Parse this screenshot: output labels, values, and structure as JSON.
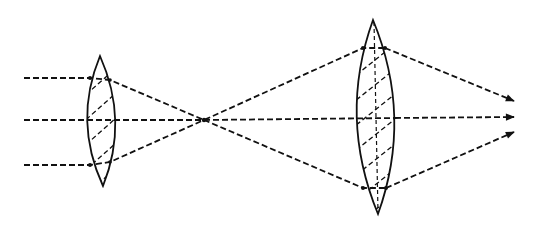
{
  "diagram": {
    "type": "optical ray diagram",
    "colors": {
      "ink": "#111111",
      "background": "#ffffff"
    },
    "lenses": [
      {
        "id": "lens-small-left",
        "cx": 101,
        "top": 56,
        "bottom": 186,
        "half_width": 14,
        "hatched": true
      },
      {
        "id": "lens-large-right",
        "cx": 375,
        "top": 20,
        "bottom": 214,
        "half_width": 19,
        "hatched": true
      }
    ],
    "focal_point": {
      "x": 204,
      "y": 120
    },
    "rays": [
      {
        "id": "ray-top",
        "input_y": 78,
        "output_end": [
          514,
          101
        ]
      },
      {
        "id": "ray-middle",
        "input_y": 120,
        "output_end": [
          514,
          117
        ]
      },
      {
        "id": "ray-bottom",
        "input_y": 165,
        "output_end": [
          514,
          132
        ]
      }
    ]
  }
}
